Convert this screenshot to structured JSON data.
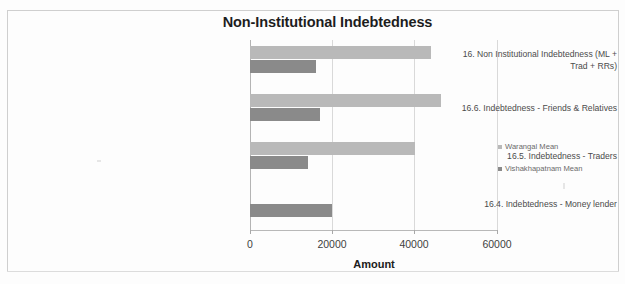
{
  "chart_data": {
    "type": "bar",
    "orientation": "horizontal",
    "title": "Non-Institutional Indebtedness",
    "xlabel": "Amount",
    "ylabel": "",
    "xlim": [
      0,
      60000
    ],
    "xticks": [
      "0",
      "20000",
      "40000",
      "60000"
    ],
    "grid": true,
    "legend_position": "right",
    "categories": [
      "16. Non Institutional Indebtedness (ML + Trad + RRs)",
      "16.6. Indebtedness - Friends & Relatives",
      "16.5. Indebtedness - Traders",
      "16.4. Indebtedness - Money lender"
    ],
    "series": [
      {
        "name": "Warangal Mean",
        "color": "#b9b9b9",
        "values": [
          44000,
          46500,
          40000,
          0
        ]
      },
      {
        "name": "Vishakhapatnam Mean",
        "color": "#8a8a8a",
        "values": [
          16000,
          17000,
          14000,
          20000
        ]
      }
    ]
  },
  "legend": {
    "items": [
      {
        "label": "Warangal Mean",
        "color": "#b9b9b9"
      },
      {
        "label": "Vishakhapatnam Mean",
        "color": "#8a8a8a"
      }
    ]
  },
  "axis": {
    "x_title": "Amount",
    "tick_0": "0",
    "tick_1": "20000",
    "tick_2": "40000",
    "tick_3": "60000"
  },
  "categories": {
    "cat_0_line_1": "16. Non Institutional Indebtedness (ML +",
    "cat_0_line_2": "Trad + RRs)",
    "cat_1": "16.6. Indebtedness - Friends & Relatives",
    "cat_2": "16.5. Indebtedness - Traders",
    "cat_3": "16.4. Indebtedness - Money lender"
  }
}
